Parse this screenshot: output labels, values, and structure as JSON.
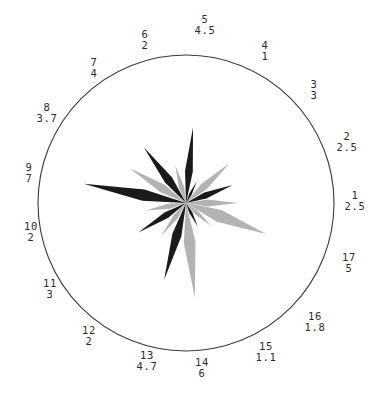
{
  "figure": {
    "kind": "polar-star-diagram",
    "background_color": "#ffffff",
    "outline_color": "#3a3a3a",
    "dark_sector_color": "#1a1a1a",
    "light_sector_color": "#b3b3b3"
  },
  "chart_data": {
    "type": "bar",
    "title": "",
    "subtitle": "",
    "xlabel": "",
    "ylabel": "",
    "grid": false,
    "legend": "none",
    "projection": "polar",
    "center": {
      "x": 186,
      "y": 203
    },
    "outer_radius": 148,
    "rlim": [
      0,
      7
    ],
    "categories": [
      "1",
      "2",
      "3",
      "4",
      "5",
      "6",
      "7",
      "8",
      "9",
      "10",
      "11",
      "12",
      "13",
      "14",
      "15",
      "16",
      "17"
    ],
    "values": [
      2.5,
      2.5,
      3,
      1,
      4.5,
      2,
      4,
      3.7,
      7,
      2,
      3,
      2,
      4.7,
      6,
      1.1,
      1.8,
      5
    ],
    "tick_labels": [
      {
        "index": "1",
        "value": "2.5",
        "x": 355,
        "y": 201,
        "angle_deg": 0
      },
      {
        "index": "2",
        "value": "2.5",
        "x": 347,
        "y": 142,
        "angle_deg": 21.2
      },
      {
        "index": "3",
        "value": "3",
        "x": 314,
        "y": 90,
        "angle_deg": 42.4
      },
      {
        "index": "4",
        "value": "1",
        "x": 265,
        "y": 51,
        "angle_deg": 63.5
      },
      {
        "index": "5",
        "value": "4.5",
        "x": 205,
        "y": 25,
        "angle_deg": 84.7
      },
      {
        "index": "6",
        "value": "2",
        "x": 145,
        "y": 40,
        "angle_deg": 105.9
      },
      {
        "index": "7",
        "value": "4",
        "x": 94,
        "y": 68,
        "angle_deg": 127.1
      },
      {
        "index": "8",
        "value": "3.7",
        "x": 47,
        "y": 113,
        "angle_deg": 148.2
      },
      {
        "index": "9",
        "value": "7",
        "x": 29,
        "y": 173,
        "angle_deg": 169.4
      },
      {
        "index": "10",
        "value": "2",
        "x": 31,
        "y": 232,
        "angle_deg": 190.6
      },
      {
        "index": "11",
        "value": "3",
        "x": 50,
        "y": 289,
        "angle_deg": 211.8
      },
      {
        "index": "12",
        "value": "2",
        "x": 89,
        "y": 336,
        "angle_deg": 232.9
      },
      {
        "index": "13",
        "value": "4.7",
        "x": 147,
        "y": 361,
        "angle_deg": 254.1
      },
      {
        "index": "14",
        "value": "6",
        "x": 202,
        "y": 368,
        "angle_deg": 275.3
      },
      {
        "index": "15",
        "value": "1.1",
        "x": 266,
        "y": 352,
        "angle_deg": 296.5
      },
      {
        "index": "16",
        "value": "1.8",
        "x": 315,
        "y": 322,
        "angle_deg": 317.6
      },
      {
        "index": "17",
        "value": "5",
        "x": 349,
        "y": 263,
        "angle_deg": 338.8
      }
    ],
    "sector_rays": [
      {
        "index": "1",
        "shade": "light",
        "angle_deg": 0,
        "half_width_deg": 9.0,
        "radius": 52
      },
      {
        "index": "2",
        "shade": "dark",
        "angle_deg": 21.2,
        "half_width_deg": 8.5,
        "radius": 50
      },
      {
        "index": "3",
        "shade": "light",
        "angle_deg": 42.4,
        "half_width_deg": 9.0,
        "radius": 59
      },
      {
        "index": "4",
        "shade": "dark",
        "angle_deg": 63.5,
        "half_width_deg": 7.5,
        "radius": 24
      },
      {
        "index": "5",
        "shade": "dark",
        "angle_deg": 84.7,
        "half_width_deg": 7.0,
        "radius": 76
      },
      {
        "index": "6",
        "shade": "light",
        "angle_deg": 105.9,
        "half_width_deg": 9.5,
        "radius": 39
      },
      {
        "index": "7",
        "shade": "dark",
        "angle_deg": 127.1,
        "half_width_deg": 8.5,
        "radius": 70
      },
      {
        "index": "8",
        "shade": "light",
        "angle_deg": 148.2,
        "half_width_deg": 9.0,
        "radius": 66
      },
      {
        "index": "9",
        "shade": "dark",
        "angle_deg": 169.4,
        "half_width_deg": 7.5,
        "radius": 104
      },
      {
        "index": "10",
        "shade": "light",
        "angle_deg": 190.6,
        "half_width_deg": 9.0,
        "radius": 41
      },
      {
        "index": "11",
        "shade": "dark",
        "angle_deg": 211.8,
        "half_width_deg": 8.0,
        "radius": 56
      },
      {
        "index": "12",
        "shade": "light",
        "angle_deg": 232.9,
        "half_width_deg": 9.0,
        "radius": 41
      },
      {
        "index": "13",
        "shade": "dark",
        "angle_deg": 254.1,
        "half_width_deg": 8.0,
        "radius": 80
      },
      {
        "index": "14",
        "shade": "light",
        "angle_deg": 275.3,
        "half_width_deg": 8.5,
        "radius": 95
      },
      {
        "index": "15",
        "shade": "dark",
        "angle_deg": 296.5,
        "half_width_deg": 8.0,
        "radius": 26
      },
      {
        "index": "16",
        "shade": "light",
        "angle_deg": 317.6,
        "half_width_deg": 9.0,
        "radius": 34
      },
      {
        "index": "17",
        "shade": "light",
        "angle_deg": 338.8,
        "half_width_deg": 10.0,
        "radius": 86
      }
    ]
  }
}
